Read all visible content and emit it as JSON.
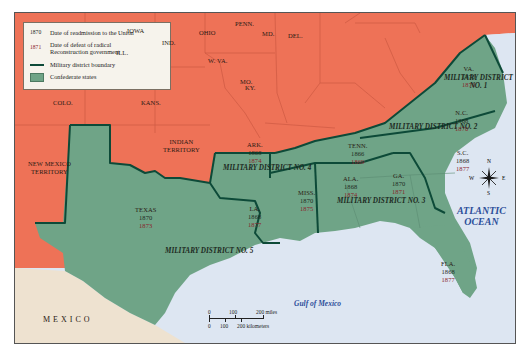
{
  "legend": {
    "readmission": {
      "key": "1870",
      "text": "Date of readmission to the Union"
    },
    "defeat": {
      "key": "1871",
      "text1": "Date of defeat of radical",
      "text2": "Reconstruction government"
    },
    "boundary": {
      "text": "Military district boundary"
    },
    "confederate": {
      "text": "Confederate states"
    }
  },
  "colors": {
    "union": "#ee7257",
    "confederate": "#6fa487",
    "boundary": "#0d4a38",
    "water": "#dde6f2",
    "mexico": "#eee2d0",
    "readmission_text": "#1d2a1d",
    "defeat_text": "#8a1e2a",
    "ocean_text": "#2d4f9a"
  },
  "union_states": [
    {
      "name": "IOWA"
    },
    {
      "name": "ILL."
    },
    {
      "name": "IND."
    },
    {
      "name": "OHIO"
    },
    {
      "name": "PENN."
    },
    {
      "name": "MD."
    },
    {
      "name": "DEL."
    },
    {
      "name": "W. VA."
    },
    {
      "name": "KY."
    },
    {
      "name": "MO."
    },
    {
      "name": "KANS."
    },
    {
      "name": "COLO."
    },
    {
      "name": "INDIAN",
      "name2": "TERRITORY"
    },
    {
      "name": "NEW MEXICO",
      "name2": "TERRITORY"
    }
  ],
  "confederate_states": [
    {
      "name": "VA.",
      "readmitted": "1870",
      "defeated": "1870"
    },
    {
      "name": "N.C.",
      "readmitted": "1868",
      "defeated": "1870"
    },
    {
      "name": "S.C.",
      "readmitted": "1868",
      "defeated": "1877"
    },
    {
      "name": "GA.",
      "readmitted": "1870",
      "defeated": "1871"
    },
    {
      "name": "FLA.",
      "readmitted": "1868",
      "defeated": "1877"
    },
    {
      "name": "ALA.",
      "readmitted": "1868",
      "defeated": "1874"
    },
    {
      "name": "MISS.",
      "readmitted": "1870",
      "defeated": "1875"
    },
    {
      "name": "TENN.",
      "readmitted": "1866",
      "defeated": "1869"
    },
    {
      "name": "ARK.",
      "readmitted": "1868",
      "defeated": "1874"
    },
    {
      "name": "LA.",
      "readmitted": "1868",
      "defeated": "1877"
    },
    {
      "name": "TEXAS",
      "readmitted": "1870",
      "defeated": "1873"
    }
  ],
  "military_districts": [
    {
      "label": "MILITARY DISTRICT",
      "label2": "NO. 1"
    },
    {
      "label": "MILITARY DISTRICT NO. 2"
    },
    {
      "label": "MILITARY DISTRICT NO. 3"
    },
    {
      "label": "MILITARY DISTRICT NO. 4"
    },
    {
      "label": "MILITARY DISTRICT NO. 5"
    }
  ],
  "water_bodies": {
    "atlantic1": "ATLANTIC",
    "atlantic2": "OCEAN",
    "gulf": "Gulf of Mexico"
  },
  "countries": {
    "mexico": "MEXICO"
  },
  "compass": {
    "n": "N",
    "s": "S",
    "e": "E",
    "w": "W"
  },
  "scale": {
    "miles": [
      "0",
      "100",
      "200 miles"
    ],
    "km": [
      "0",
      "100",
      "200 kilometers"
    ]
  }
}
